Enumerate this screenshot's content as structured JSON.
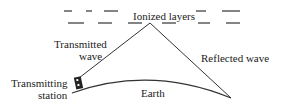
{
  "diagram": {
    "labels": {
      "ionized_layers": "Ionized layers",
      "transmitted_wave_line1": "Transmitted",
      "transmitted_wave_line2": "wave",
      "reflected_wave": "Reflected wave",
      "transmitting_station_line1": "Transmitting",
      "transmitting_station_line2": "station",
      "earth": "Earth"
    },
    "colors": {
      "line": "#333333",
      "background": "#ffffff"
    }
  }
}
